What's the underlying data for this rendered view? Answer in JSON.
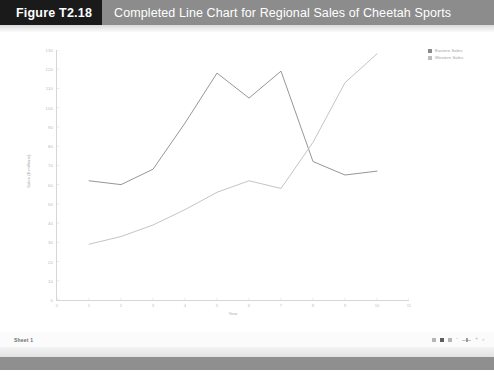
{
  "header": {
    "figure_tag": "Figure T2.18",
    "title": "Completed Line Chart for Regional Sales of Cheetah Sports",
    "tag_bg": "#1a1a1a",
    "banner_bg": "#8c8c8c",
    "text_color": "#ffffff"
  },
  "statusbar": {
    "sheet_tab": "Sheet 1",
    "zoom_minus": "−",
    "zoom_plus": "+",
    "zoom_glyph": "⌕"
  },
  "chart_data": {
    "type": "line",
    "title": "",
    "xlabel": "Year",
    "ylabel": "Sales ($ millions)",
    "x": [
      1,
      2,
      3,
      4,
      5,
      6,
      7,
      8,
      9,
      10
    ],
    "xlim": [
      0,
      11
    ],
    "ylim": [
      0,
      130
    ],
    "xticks": [
      0,
      1,
      2,
      3,
      4,
      5,
      6,
      7,
      8,
      9,
      10,
      11
    ],
    "yticks": [
      0,
      10,
      20,
      30,
      40,
      50,
      60,
      70,
      80,
      90,
      100,
      110,
      120,
      130
    ],
    "grid": false,
    "legend_position": "top-right",
    "series": [
      {
        "name": "Eastern Sales",
        "color": "#8a8a8a",
        "values": [
          62,
          60,
          68,
          92,
          118,
          105,
          119,
          72,
          65,
          67
        ]
      },
      {
        "name": "Western Sales",
        "color": "#bdbdbd",
        "values": [
          29,
          33,
          39,
          47,
          56,
          62,
          58,
          82,
          113,
          128
        ]
      }
    ]
  }
}
